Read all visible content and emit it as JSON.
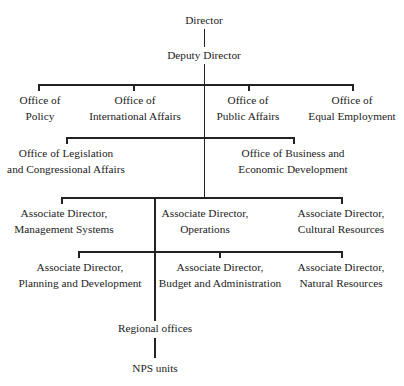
{
  "chart": {
    "type": "org-chart",
    "nodes": {
      "director": {
        "lines": [
          "Director"
        ]
      },
      "deputy_director": {
        "lines": [
          "Deputy Director"
        ]
      },
      "office_policy": {
        "lines": [
          "Office of",
          "Policy"
        ]
      },
      "office_international": {
        "lines": [
          "Office of",
          "International Affairs"
        ]
      },
      "office_public": {
        "lines": [
          "Office of",
          "Public Affairs"
        ]
      },
      "office_equal": {
        "lines": [
          "Office of",
          "Equal Employment"
        ]
      },
      "office_legislation": {
        "lines": [
          "Office of Legislation",
          "and Congressional Affairs"
        ]
      },
      "office_business": {
        "lines": [
          "Office of Business and",
          "Economic Development"
        ]
      },
      "ad_management": {
        "lines": [
          "Associate Director,",
          "Management Systems"
        ]
      },
      "ad_operations": {
        "lines": [
          "Associate Director,",
          "Operations"
        ]
      },
      "ad_cultural": {
        "lines": [
          "Associate Director,",
          "Cultural Resources"
        ]
      },
      "ad_planning": {
        "lines": [
          "Associate Director,",
          "Planning and Development"
        ]
      },
      "ad_budget": {
        "lines": [
          "Associate Director,",
          "Budget and Administration"
        ]
      },
      "ad_natural": {
        "lines": [
          "Associate Director,",
          "Natural Resources"
        ]
      },
      "regional": {
        "lines": [
          "Regional offices"
        ]
      },
      "nps_units": {
        "lines": [
          "NPS units"
        ]
      }
    },
    "line_color": "#222222"
  }
}
